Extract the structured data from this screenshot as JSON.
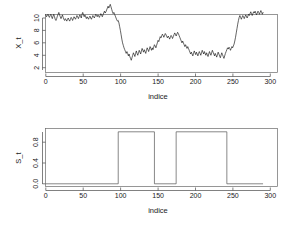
{
  "figure": {
    "background": "#ffffff",
    "line_color": "#111111",
    "axis_color": "#4a4a4a"
  },
  "chart_data": [
    {
      "type": "line",
      "panel": "top",
      "title": "",
      "xlabel": "indice",
      "ylabel": "X_t",
      "xlim": [
        0,
        310
      ],
      "ylim": [
        1.6,
        12.6
      ],
      "xticks": [
        0,
        50,
        100,
        150,
        200,
        250,
        300
      ],
      "xticklabels": [
        "0",
        "50",
        "100",
        "150",
        "200",
        "250",
        "300"
      ],
      "yticks": [
        2,
        4,
        6,
        8,
        10
      ],
      "yticklabels": [
        "2",
        "4",
        "6",
        "8",
        "10"
      ],
      "grid": false,
      "legend": "none",
      "x": [
        0,
        1,
        2,
        3,
        4,
        5,
        6,
        7,
        8,
        9,
        10,
        11,
        12,
        13,
        14,
        15,
        16,
        17,
        18,
        19,
        20,
        21,
        22,
        23,
        24,
        25,
        26,
        27,
        28,
        29,
        30,
        31,
        32,
        33,
        34,
        35,
        36,
        37,
        38,
        39,
        40,
        41,
        42,
        43,
        44,
        45,
        46,
        47,
        48,
        49,
        50,
        51,
        52,
        53,
        54,
        55,
        56,
        57,
        58,
        59,
        60,
        61,
        62,
        63,
        64,
        65,
        66,
        67,
        68,
        69,
        70,
        71,
        72,
        73,
        74,
        75,
        76,
        77,
        78,
        79,
        80,
        81,
        82,
        83,
        84,
        85,
        86,
        87,
        88,
        89,
        90,
        91,
        92,
        93,
        94,
        95,
        96,
        97,
        98,
        99,
        100,
        101,
        102,
        103,
        104,
        105,
        106,
        107,
        108,
        109,
        110,
        111,
        112,
        113,
        114,
        115,
        116,
        117,
        118,
        119,
        120,
        121,
        122,
        123,
        124,
        125,
        126,
        127,
        128,
        129,
        130,
        131,
        132,
        133,
        134,
        135,
        136,
        137,
        138,
        139,
        140,
        141,
        142,
        143,
        144,
        145,
        146,
        147,
        148,
        149,
        150,
        151,
        152,
        153,
        154,
        155,
        156,
        157,
        158,
        159,
        160,
        161,
        162,
        163,
        164,
        165,
        166,
        167,
        168,
        169,
        170,
        171,
        172,
        173,
        174,
        175,
        176,
        177,
        178,
        179,
        180,
        181,
        182,
        183,
        184,
        185,
        186,
        187,
        188,
        189,
        190,
        191,
        192,
        193,
        194,
        195,
        196,
        197,
        198,
        199,
        200,
        201,
        202,
        203,
        204,
        205,
        206,
        207,
        208,
        209,
        210,
        211,
        212,
        213,
        214,
        215,
        216,
        217,
        218,
        219,
        220,
        221,
        222,
        223,
        224,
        225,
        226,
        227,
        228,
        229,
        230,
        231,
        232,
        233,
        234,
        235,
        236,
        237,
        238,
        239,
        240,
        241,
        242,
        243,
        244,
        245,
        246,
        247,
        248,
        249,
        250,
        251,
        252,
        253,
        254,
        255,
        256,
        257,
        258,
        259,
        260,
        261,
        262,
        263,
        264,
        265,
        266,
        267,
        268,
        269,
        270,
        271,
        272,
        273,
        274,
        275,
        276,
        277,
        278,
        279,
        280,
        281,
        282,
        283,
        284,
        285,
        286,
        287,
        288,
        289,
        290,
        291,
        292,
        293,
        294,
        295,
        296,
        297,
        298,
        299,
        300
      ],
      "values": [
        10.5,
        10.2,
        10.4,
        10.6,
        10.3,
        10.1,
        10.4,
        10.6,
        10.2,
        9.9,
        10.3,
        10.6,
        10.2,
        9.8,
        9.6,
        9.9,
        10.3,
        10.6,
        10.9,
        10.5,
        10.2,
        9.9,
        10.2,
        10.5,
        10.1,
        9.8,
        9.6,
        9.9,
        9.7,
        9.5,
        9.8,
        10.0,
        9.7,
        9.5,
        9.8,
        10.1,
        9.9,
        9.6,
        9.9,
        10.2,
        10.0,
        9.8,
        10.1,
        10.4,
        10.2,
        9.9,
        10.2,
        10.5,
        10.3,
        10.0,
        10.6,
        10.9,
        10.5,
        10.2,
        10.5,
        10.2,
        9.9,
        10.2,
        10.0,
        9.8,
        10.1,
        10.3,
        10.0,
        9.8,
        10.1,
        10.4,
        10.2,
        10.0,
        10.3,
        10.6,
        10.4,
        10.2,
        10.5,
        10.3,
        10.1,
        10.4,
        10.7,
        10.5,
        10.2,
        10.5,
        10.8,
        11.1,
        10.8,
        11.0,
        11.3,
        11.6,
        11.9,
        11.6,
        11.9,
        12.2,
        11.8,
        11.4,
        11.0,
        10.7,
        10.9,
        10.6,
        10.3,
        10.0,
        9.7,
        9.5,
        9.6,
        9.2,
        8.6,
        8.0,
        7.3,
        6.6,
        6.0,
        5.6,
        5.2,
        4.9,
        4.6,
        4.3,
        4.6,
        4.3,
        3.9,
        4.2,
        3.8,
        3.5,
        3.2,
        3.6,
        4.0,
        4.4,
        4.1,
        3.8,
        4.3,
        4.7,
        4.3,
        4.0,
        4.4,
        4.8,
        4.5,
        4.2,
        4.7,
        5.1,
        4.8,
        4.5,
        4.9,
        4.6,
        4.3,
        4.8,
        5.2,
        4.9,
        4.6,
        5.0,
        5.4,
        5.1,
        4.8,
        5.2,
        4.9,
        5.3,
        5.7,
        5.5,
        5.2,
        5.6,
        6.0,
        6.4,
        6.2,
        6.6,
        7.0,
        6.8,
        7.1,
        7.4,
        7.2,
        6.9,
        7.2,
        7.5,
        7.3,
        7.0,
        6.8,
        7.1,
        6.9,
        6.6,
        6.9,
        7.2,
        7.0,
        6.7,
        7.0,
        7.3,
        7.6,
        7.4,
        7.1,
        7.4,
        7.7,
        7.5,
        7.2,
        6.9,
        6.6,
        6.3,
        6.0,
        6.3,
        6.0,
        5.7,
        5.4,
        5.7,
        5.4,
        5.1,
        5.4,
        5.1,
        4.8,
        4.5,
        4.2,
        4.5,
        4.2,
        3.9,
        4.3,
        4.7,
        4.4,
        4.1,
        4.5,
        4.2,
        3.9,
        4.3,
        4.6,
        4.3,
        4.0,
        4.4,
        4.8,
        4.5,
        4.2,
        4.6,
        4.3,
        4.0,
        4.4,
        4.1,
        3.8,
        4.2,
        4.6,
        4.3,
        4.0,
        4.4,
        4.8,
        4.5,
        4.2,
        3.9,
        4.3,
        4.0,
        3.7,
        4.1,
        4.5,
        4.2,
        3.9,
        3.6,
        4.0,
        4.4,
        4.1,
        3.8,
        3.5,
        3.9,
        4.3,
        4.6,
        4.9,
        5.2,
        5.0,
        5.3,
        5.1,
        4.8,
        5.1,
        5.4,
        5.2,
        5.5,
        5.8,
        6.3,
        6.9,
        7.6,
        8.3,
        9.0,
        9.6,
        10.1,
        10.4,
        10.1,
        9.8,
        10.1,
        10.4,
        10.2,
        9.9,
        10.2,
        10.5,
        10.3,
        10.0,
        10.3,
        10.6,
        10.4,
        10.7,
        11.0,
        10.7,
        10.4,
        10.7,
        11.0,
        10.8,
        11.1,
        10.8,
        10.5,
        10.8,
        11.1,
        10.9,
        10.6,
        10.9,
        11.2,
        10.9,
        10.6,
        10.9,
        11.2,
        11.0,
        10.8,
        11.1,
        10.9
      ]
    },
    {
      "type": "line",
      "panel": "bottom",
      "title": "",
      "xlabel": "indice",
      "ylabel": "S_t",
      "xlim": [
        0,
        310
      ],
      "ylim": [
        -0.04,
        1.04
      ],
      "xticks": [
        0,
        50,
        100,
        150,
        200,
        250,
        300
      ],
      "xticklabels": [
        "0",
        "50",
        "100",
        "150",
        "200",
        "250",
        "300"
      ],
      "yticks": [
        0.0,
        0.4,
        0.8
      ],
      "yticklabels": [
        "0.0",
        "0.4",
        "0.8"
      ],
      "grid": false,
      "legend": "none",
      "step_segments": [
        {
          "x_start": 0,
          "x_end": 100,
          "value": 0
        },
        {
          "x_start": 100,
          "x_end": 150,
          "value": 1
        },
        {
          "x_start": 150,
          "x_end": 180,
          "value": 0
        },
        {
          "x_start": 180,
          "x_end": 250,
          "value": 1
        },
        {
          "x_start": 250,
          "x_end": 300,
          "value": 0
        }
      ]
    }
  ]
}
